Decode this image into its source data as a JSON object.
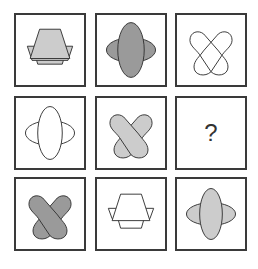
{
  "puzzle": {
    "type": "3x3 matrix reasoning",
    "colors": {
      "dark_fill": "#9a9a9a",
      "light_fill": "#cccccc",
      "none_fill": "#ffffff",
      "stroke": "#333333"
    },
    "cells": [
      {
        "row": 1,
        "col": 1,
        "shape": "trapezoid-hexagon",
        "fill": "light"
      },
      {
        "row": 1,
        "col": 2,
        "shape": "ellipse-cross",
        "fill": "dark"
      },
      {
        "row": 1,
        "col": 3,
        "shape": "double-heart",
        "fill": "none"
      },
      {
        "row": 2,
        "col": 1,
        "shape": "ellipse-cross",
        "fill": "none"
      },
      {
        "row": 2,
        "col": 2,
        "shape": "double-heart",
        "fill": "light"
      },
      {
        "row": 2,
        "col": 3,
        "shape": "unknown",
        "label": "?"
      },
      {
        "row": 3,
        "col": 1,
        "shape": "double-heart",
        "fill": "dark"
      },
      {
        "row": 3,
        "col": 2,
        "shape": "trapezoid-hexagon",
        "fill": "none"
      },
      {
        "row": 3,
        "col": 3,
        "shape": "ellipse-cross",
        "fill": "light"
      }
    ],
    "question_mark": "?"
  }
}
